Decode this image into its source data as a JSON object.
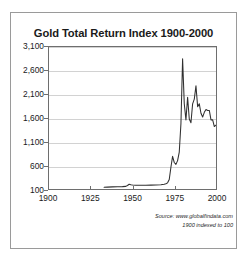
{
  "chart_data": {
    "type": "line",
    "title": "Gold Total Return Index 1900-2000",
    "xlabel": "",
    "ylabel": "",
    "xlim": [
      1900,
      2000
    ],
    "ylim": [
      100,
      3100
    ],
    "grid": true,
    "legend": null,
    "xticks": [
      1900,
      1925,
      1950,
      1975,
      2000
    ],
    "xtick_labels": [
      "1900",
      "1925",
      "1950",
      "1975",
      "2000"
    ],
    "yticks": [
      100,
      600,
      1100,
      1600,
      2100,
      2600,
      3100
    ],
    "ytick_labels": [
      "100",
      "600",
      "1,100",
      "1,600",
      "2,100",
      "2,600",
      "3,100"
    ],
    "series": [
      {
        "name": "Gold Total Return Index",
        "color": "#303030",
        "x": [
          1933,
          1935,
          1938,
          1941,
          1944,
          1946,
          1947,
          1948,
          1949,
          1950,
          1952,
          1955,
          1958,
          1961,
          1964,
          1967,
          1969,
          1970,
          1971,
          1972,
          1973,
          1974,
          1975,
          1976,
          1977,
          1978,
          1979,
          1980,
          1981,
          1982,
          1983,
          1984,
          1985,
          1986,
          1987,
          1988,
          1989,
          1990,
          1991,
          1992,
          1993,
          1994,
          1995,
          1996,
          1997,
          1998,
          1999,
          2000
        ],
        "y": [
          135,
          140,
          145,
          148,
          150,
          155,
          175,
          200,
          190,
          185,
          180,
          178,
          180,
          182,
          185,
          190,
          200,
          210,
          230,
          300,
          560,
          790,
          660,
          620,
          700,
          880,
          1480,
          2850,
          1900,
          1560,
          2040,
          1580,
          1500,
          1900,
          2000,
          2280,
          1840,
          1900,
          1700,
          1620,
          1720,
          1780,
          1760,
          1760,
          1560,
          1560,
          1420,
          1450
        ]
      }
    ],
    "annotations": [
      "Source: www.globalfindata.com",
      "1900 indexed to 100"
    ]
  },
  "source": {
    "line1": "Source: www.globalfindata.com",
    "line2": "1900 indexed to 100"
  }
}
